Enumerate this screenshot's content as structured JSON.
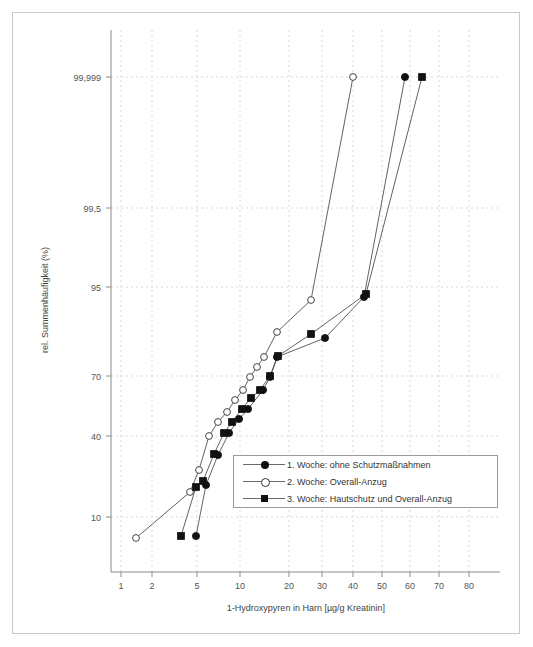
{
  "figure": {
    "background": "#ffffff",
    "border_color": "#c9c9c9"
  },
  "chart_data": {
    "type": "line",
    "title": "",
    "subtitle": "",
    "xlabel": "1-Hydroxypyren in Harn [µg/g Kreatinin]",
    "ylabel": "rel. Summenhäufigkeit (%)",
    "x_scale": "log-probability-paper",
    "y_scale": "probability",
    "grid": true,
    "legend_position": "inside-bottom-right",
    "x_ticks": [
      {
        "label": "1",
        "value": 1,
        "px": 121
      },
      {
        "label": "2",
        "value": 2,
        "px": 152
      },
      {
        "label": "5",
        "value": 5,
        "px": 197
      },
      {
        "label": "10",
        "value": 10,
        "px": 240
      },
      {
        "label": "20",
        "value": 20,
        "px": 289
      },
      {
        "label": "30",
        "value": 30,
        "px": 322
      },
      {
        "label": "40",
        "value": 40,
        "px": 353
      },
      {
        "label": "50",
        "value": 50,
        "px": 382
      },
      {
        "label": "60",
        "value": 60,
        "px": 410
      },
      {
        "label": "70",
        "value": 70,
        "px": 439
      },
      {
        "label": "80",
        "value": 80,
        "px": 469
      }
    ],
    "y_ticks": [
      {
        "label": "99,999",
        "value": 99.999,
        "px": 77
      },
      {
        "label": "99,5",
        "value": 99.5,
        "px": 208
      },
      {
        "label": "95",
        "value": 95,
        "px": 287
      },
      {
        "label": "70",
        "value": 70,
        "px": 376
      },
      {
        "label": "40",
        "value": 40,
        "px": 436
      },
      {
        "label": "10",
        "value": 10,
        "px": 517
      }
    ],
    "series": [
      {
        "name": "1. Woche: ohne Schutzmaßnahmen",
        "marker": "filled-circle",
        "points": [
          {
            "x": 4.6,
            "y": 10.0,
            "px": 196,
            "py": 536
          },
          {
            "x": 5.3,
            "y": 23.0,
            "px": 206,
            "py": 485
          },
          {
            "x": 6.4,
            "y": 33.0,
            "px": 218,
            "py": 455
          },
          {
            "x": 7.6,
            "y": 43.0,
            "px": 229,
            "py": 433
          },
          {
            "x": 9.0,
            "y": 50.0,
            "px": 239,
            "py": 419
          },
          {
            "x": 10.4,
            "y": 56.0,
            "px": 248,
            "py": 409
          },
          {
            "x": 13.0,
            "y": 66.0,
            "px": 263,
            "py": 390
          },
          {
            "x": 14.8,
            "y": 70.0,
            "px": 270,
            "py": 377
          },
          {
            "x": 16.5,
            "y": 76.0,
            "px": 277,
            "py": 357
          },
          {
            "x": 31.0,
            "y": 83.0,
            "px": 325,
            "py": 338
          },
          {
            "x": 44.0,
            "y": 94.0,
            "px": 364,
            "py": 297
          },
          {
            "x": 57.0,
            "y": 99.999,
            "px": 405,
            "py": 77
          }
        ]
      },
      {
        "name": "2. Woche: Overall-Anzug",
        "marker": "open-circle",
        "points": [
          {
            "x": 1.55,
            "y": 9.0,
            "px": 136,
            "py": 538
          },
          {
            "x": 4.2,
            "y": 22.0,
            "px": 190,
            "py": 492
          },
          {
            "x": 4.8,
            "y": 28.0,
            "px": 199,
            "py": 470
          },
          {
            "x": 5.6,
            "y": 40.0,
            "px": 209,
            "py": 436
          },
          {
            "x": 6.4,
            "y": 48.0,
            "px": 218,
            "py": 422
          },
          {
            "x": 7.4,
            "y": 54.0,
            "px": 227,
            "py": 412
          },
          {
            "x": 8.4,
            "y": 61.0,
            "px": 235,
            "py": 400
          },
          {
            "x": 9.6,
            "y": 66.0,
            "px": 243,
            "py": 390
          },
          {
            "x": 10.8,
            "y": 70.0,
            "px": 250,
            "py": 377
          },
          {
            "x": 12.0,
            "y": 73.0,
            "px": 257,
            "py": 367
          },
          {
            "x": 13.4,
            "y": 76.0,
            "px": 264,
            "py": 357
          },
          {
            "x": 16.5,
            "y": 80.0,
            "px": 277,
            "py": 332
          },
          {
            "x": 26.5,
            "y": 93.0,
            "px": 311,
            "py": 300
          },
          {
            "x": 39.0,
            "y": 99.999,
            "px": 353,
            "py": 77
          }
        ]
      },
      {
        "name": "3. Woche: Hautschutz und Overall-Anzug",
        "marker": "filled-square",
        "points": [
          {
            "x": 3.9,
            "y": 10.0,
            "px": 181,
            "py": 536
          },
          {
            "x": 4.6,
            "y": 23.0,
            "px": 196,
            "py": 487
          },
          {
            "x": 5.1,
            "y": 25.0,
            "px": 203,
            "py": 481
          },
          {
            "x": 6.0,
            "y": 34.0,
            "px": 214,
            "py": 454
          },
          {
            "x": 7.0,
            "y": 43.0,
            "px": 224,
            "py": 433
          },
          {
            "x": 8.0,
            "y": 48.0,
            "px": 232,
            "py": 422
          },
          {
            "x": 9.5,
            "y": 56.0,
            "px": 242,
            "py": 409
          },
          {
            "x": 11.0,
            "y": 62.0,
            "px": 251,
            "py": 398
          },
          {
            "x": 12.5,
            "y": 66.0,
            "px": 260,
            "py": 390
          },
          {
            "x": 14.8,
            "y": 70.0,
            "px": 270,
            "py": 376
          },
          {
            "x": 16.8,
            "y": 76.0,
            "px": 278,
            "py": 356
          },
          {
            "x": 26.5,
            "y": 84.0,
            "px": 311,
            "py": 334
          },
          {
            "x": 45.0,
            "y": 94.0,
            "px": 366,
            "py": 294
          },
          {
            "x": 63.0,
            "y": 99.999,
            "px": 422,
            "py": 77
          }
        ]
      }
    ]
  },
  "legend": {
    "items": [
      {
        "label": "1. Woche: ohne Schutzmaßnahmen",
        "marker": "filled-circle"
      },
      {
        "label": "2. Woche: Overall-Anzug",
        "marker": "open-circle"
      },
      {
        "label": "3. Woche: Hautschutz und Overall-Anzug",
        "marker": "filled-square"
      }
    ]
  }
}
